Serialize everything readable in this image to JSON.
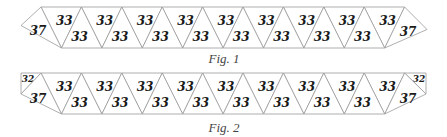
{
  "figures": [
    {
      "caption": "Fig. 1",
      "end_labels": {
        "left": "37",
        "right": "37"
      },
      "upper_triangle_labels": [
        "33",
        "33",
        "33",
        "33",
        "33",
        "33",
        "33",
        "33",
        "33"
      ],
      "lower_triangle_labels": [
        "33",
        "33",
        "33",
        "33",
        "33",
        "33",
        "33",
        "33"
      ]
    },
    {
      "caption": "Fig. 2",
      "end_labels": {
        "left": "37",
        "right": "37",
        "left_corner": "32",
        "right_corner": "32"
      },
      "upper_triangle_labels": [
        "33",
        "33",
        "33",
        "33",
        "33",
        "33",
        "33",
        "33",
        "33"
      ],
      "lower_triangle_labels": [
        "33",
        "33",
        "33",
        "33",
        "33",
        "33",
        "33",
        "33"
      ]
    }
  ],
  "colors": {
    "edge": "#9a9a9a",
    "label": "#1a1a1a",
    "caption": "#444444"
  }
}
